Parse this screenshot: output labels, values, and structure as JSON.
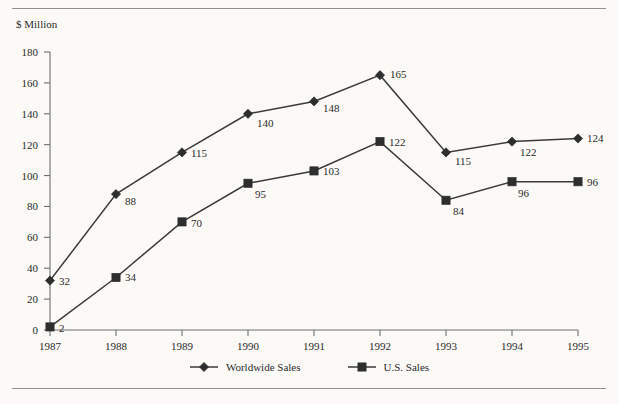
{
  "page": {
    "clipped_header_text": "",
    "background_color": "#fbfaf7",
    "rule_color": "#8f8f8f"
  },
  "chart_data": {
    "type": "line",
    "title": "",
    "subtitle": "",
    "xlabel": "",
    "ylabel": "$ Million",
    "categories": [
      "1987",
      "1988",
      "1989",
      "1990",
      "1991",
      "1992",
      "1993",
      "1994",
      "1995"
    ],
    "ylim": [
      0,
      180
    ],
    "ytick_values": [
      0,
      20,
      40,
      60,
      80,
      100,
      120,
      140,
      160,
      180
    ],
    "ytick_labels": [
      "0",
      "20",
      "40",
      "60",
      "80",
      "100",
      "120",
      "140",
      "160",
      "180"
    ],
    "grid": false,
    "legend_position": "bottom-center",
    "show_data_labels": true,
    "series": [
      {
        "name": "Worldwide Sales",
        "marker": "diamond",
        "color": "#2e2e2e",
        "values": [
          32,
          88,
          115,
          140,
          148,
          165,
          115,
          122,
          124
        ],
        "labels": [
          "32",
          "88",
          "115",
          "140",
          "148",
          "165",
          "115",
          "122",
          "124"
        ]
      },
      {
        "name": "U.S. Sales",
        "marker": "square",
        "color": "#2e2e2e",
        "values": [
          2,
          34,
          70,
          95,
          103,
          122,
          84,
          96,
          96
        ],
        "labels": [
          "2",
          "34",
          "70",
          "95",
          "103",
          "122",
          "84",
          "96",
          "96"
        ]
      }
    ]
  },
  "legend": {
    "items": [
      {
        "label": "Worldwide Sales",
        "marker": "diamond"
      },
      {
        "label": "U.S. Sales",
        "marker": "square"
      }
    ]
  }
}
